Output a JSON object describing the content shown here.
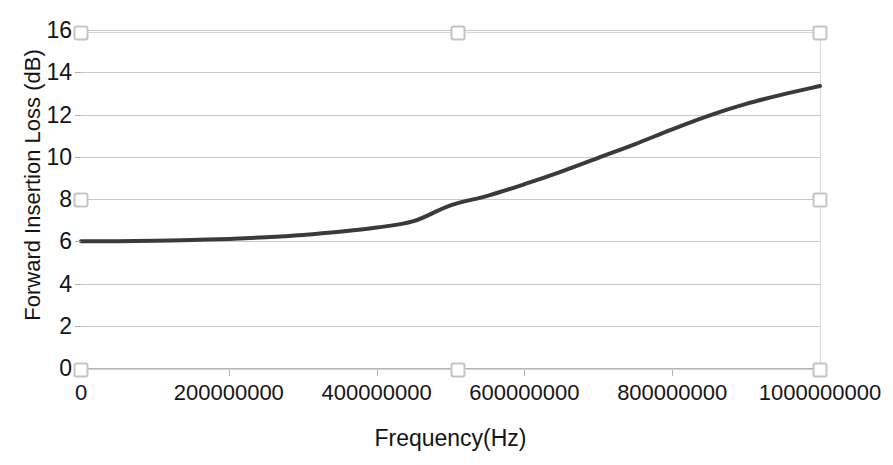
{
  "chart_data": {
    "type": "line",
    "title": "",
    "xlabel": "Frequency(Hz)",
    "ylabel": "Forward Insertion Loss (dB)",
    "xlim": [
      0,
      1000000000
    ],
    "ylim": [
      0,
      16
    ],
    "xticks": [
      "0",
      "200000000",
      "400000000",
      "600000000",
      "800000000",
      "1000000000"
    ],
    "xtick_values": [
      0,
      200000000,
      400000000,
      600000000,
      800000000,
      1000000000
    ],
    "yticks": [
      "0",
      "2",
      "4",
      "6",
      "8",
      "10",
      "12",
      "14",
      "16"
    ],
    "ytick_values": [
      0,
      2,
      4,
      6,
      8,
      10,
      12,
      14,
      16
    ],
    "grid": "horizontal",
    "legend": "none",
    "series": [
      {
        "name": "Forward Insertion Loss",
        "color": "#3a3a3a",
        "line_width": 4,
        "x": [
          0,
          50000000,
          100000000,
          150000000,
          200000000,
          250000000,
          300000000,
          350000000,
          400000000,
          450000000,
          500000000,
          550000000,
          600000000,
          650000000,
          700000000,
          750000000,
          800000000,
          850000000,
          900000000,
          950000000,
          1000000000
        ],
        "values": [
          6.0,
          6.0,
          6.02,
          6.06,
          6.11,
          6.19,
          6.3,
          6.45,
          6.65,
          6.95,
          7.7,
          8.15,
          8.7,
          9.3,
          9.95,
          10.6,
          11.3,
          11.95,
          12.5,
          12.95,
          13.35
        ]
      }
    ]
  },
  "selection": {
    "handle_label": "resize-handle",
    "handles": [
      {
        "name": "top-left",
        "x": 81,
        "y": 33
      },
      {
        "name": "top-center",
        "x": 458,
        "y": 33
      },
      {
        "name": "top-right",
        "x": 820,
        "y": 33
      },
      {
        "name": "middle-left",
        "x": 81,
        "y": 200
      },
      {
        "name": "middle-right",
        "x": 820,
        "y": 200
      },
      {
        "name": "bottom-left",
        "x": 81,
        "y": 370
      },
      {
        "name": "bottom-center",
        "x": 458,
        "y": 370
      },
      {
        "name": "bottom-right",
        "x": 820,
        "y": 370
      }
    ]
  }
}
